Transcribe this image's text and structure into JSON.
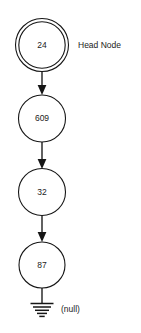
{
  "diagram": {
    "type": "linked-list",
    "background_color": "#ffffff",
    "stroke_color": "#161616",
    "text_color": "#1b1b1b",
    "nodes": [
      {
        "value": "24",
        "shape": "double-circle",
        "cx": 42,
        "cy": 45,
        "r": 26
      },
      {
        "value": "609",
        "shape": "circle",
        "cx": 42,
        "cy": 118,
        "r": 24
      },
      {
        "value": "32",
        "shape": "circle",
        "cx": 42,
        "cy": 192,
        "r": 24
      },
      {
        "value": "87",
        "shape": "circle",
        "cx": 42,
        "cy": 265,
        "r": 23
      }
    ],
    "annotations": [
      {
        "id": "head-node-label",
        "label": "Head Node",
        "x": 78,
        "y": 45
      },
      {
        "id": "null-label",
        "label": "(null)",
        "x": 61,
        "y": 312
      }
    ],
    "terminator": {
      "id": "ground-symbol",
      "name": "ground",
      "bars": 5,
      "stem_x": 42,
      "stem_top": 288,
      "stem_bottom": 303
    },
    "arrow_count": 3
  }
}
